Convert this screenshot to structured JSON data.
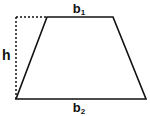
{
  "diagram": {
    "shape": "trapezoid",
    "labels": {
      "top_base": "b",
      "top_base_sub": "1",
      "bottom_base": "b",
      "bottom_base_sub": "2",
      "height": "h"
    },
    "colors": {
      "stroke": "#111111",
      "background": "#ffffff"
    }
  }
}
